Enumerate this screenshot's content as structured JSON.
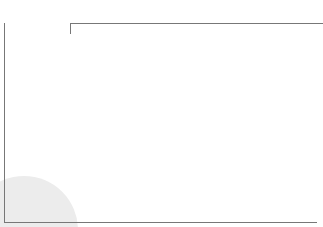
{
  "header": {
    "size_title": "Size of Units",
    "relationship_title_line1": "Relationship",
    "relationship_title_line2": "with the Ground"
  },
  "colors": {
    "light_dot": "#a4a4a4",
    "dark_dot": "#7a7a7a",
    "frame_line": "#777777",
    "highlight_circle": "#ececec"
  },
  "sections": [
    {
      "category": "Plants",
      "columns": [
        "Trees",
        "Shrubs",
        "Grass",
        "Climber",
        "Aquatic"
      ],
      "rows": [
        {
          "relationship": "Planted in the ground",
          "shades": [
            "light",
            "dark",
            "dark",
            "dark",
            "dark"
          ]
        },
        {
          "relationship": "Planted in container",
          "shades": [
            "dark",
            "dark",
            "dark",
            "dark",
            "dark"
          ]
        }
      ]
    },
    {
      "category": "Pavement",
      "columns": [
        "Small",
        "Middle",
        "Large"
      ],
      "rows": [
        {
          "relationship": "Cement the ground",
          "shades": [
            "light",
            "light",
            "light"
          ]
        },
        {
          "relationship": "Built on stilts",
          "shades": [
            "dark",
            "dark",
            "dark"
          ]
        }
      ]
    },
    {
      "category": "Constructions",
      "columns": [
        "Small",
        "Middle",
        "Large"
      ],
      "rows": [
        {
          "relationship": "Foundation deep",
          "shades": [
            "light",
            "light",
            "light"
          ]
        },
        {
          "relationship": "Foundation shallow",
          "shades": [
            "dark",
            "dark",
            "dark"
          ]
        }
      ]
    },
    {
      "category": "Faclities",
      "columns": [
        "Small",
        "Middle",
        "Large"
      ],
      "rows": [
        {
          "relationship": "Foundation deep",
          "shades": [
            "light",
            "light",
            "light"
          ]
        },
        {
          "relationship": "Foundation shallow",
          "shades": [
            "dark",
            "dark",
            "dark"
          ]
        }
      ]
    }
  ]
}
